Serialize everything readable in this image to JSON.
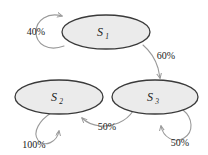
{
  "diagram": {
    "type": "state-transition-diagram",
    "background_color": "#ffffff",
    "node_fill": "#ebebeb",
    "node_stroke": "#3a3a3a",
    "edge_stroke": "#9a9a9a",
    "label_color": "#1a1a1a"
  },
  "states": [
    {
      "id": "s1",
      "base": "S",
      "subscript": "1",
      "full_label": "S1",
      "cx": 106,
      "cy": 32,
      "rx": 44,
      "ry": 17
    },
    {
      "id": "s2",
      "base": "S",
      "subscript": "2",
      "full_label": "S2",
      "cx": 59,
      "cy": 97,
      "rx": 44,
      "ry": 17
    },
    {
      "id": "s3",
      "base": "S",
      "subscript": "3",
      "full_label": "S3",
      "cx": 155,
      "cy": 97,
      "rx": 43,
      "ry": 17
    }
  ],
  "transitions": [
    {
      "id": "t-s1-s1",
      "from": "s1",
      "to": "s1",
      "kind": "self-loop",
      "label": "40%",
      "label_x": 36,
      "label_y": 35
    },
    {
      "id": "t-s1-s3",
      "from": "s1",
      "to": "s3",
      "kind": "directed",
      "label": "60%",
      "label_x": 166,
      "label_y": 59
    },
    {
      "id": "t-s3-s2",
      "from": "s3",
      "to": "s2",
      "kind": "directed",
      "label": "50%",
      "label_x": 107,
      "label_y": 130
    },
    {
      "id": "t-s3-s3",
      "from": "s3",
      "to": "s3",
      "kind": "self-loop",
      "label": "50%",
      "label_x": 180,
      "label_y": 146
    },
    {
      "id": "t-s2-s2",
      "from": "s2",
      "to": "s2",
      "kind": "self-loop",
      "label": "100%",
      "label_x": 34,
      "label_y": 148
    }
  ]
}
